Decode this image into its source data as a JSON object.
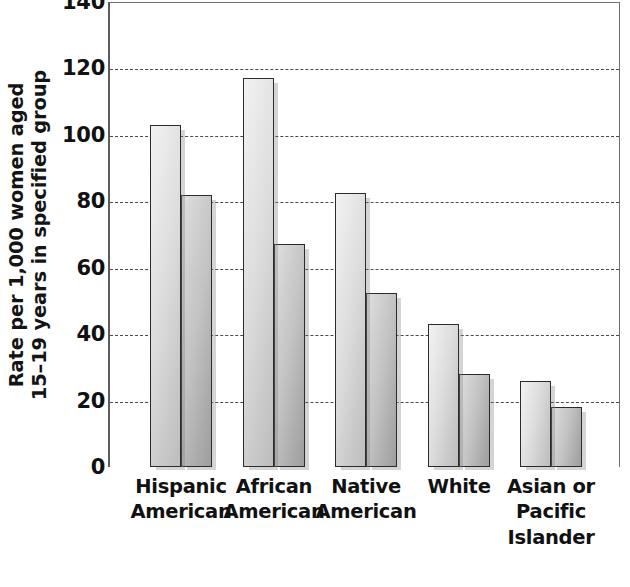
{
  "chart_data": {
    "type": "bar",
    "title": "",
    "subtitle": "",
    "xlabel": "",
    "ylabel_line1": "Rate per 1,000 women aged",
    "ylabel_line2": "15–19 years in specified group",
    "categories": [
      [
        "Hispanic",
        "American"
      ],
      [
        "African",
        "American"
      ],
      [
        "Native",
        "American"
      ],
      [
        "White"
      ],
      [
        "Asian or",
        "Pacific",
        "Islander"
      ]
    ],
    "category_names": [
      "Hispanic American",
      "African American",
      "Native American",
      "White",
      "Asian or Pacific Islander"
    ],
    "series": [
      {
        "name": "series-1",
        "values": [
          103,
          117,
          82.5,
          43,
          26
        ]
      },
      {
        "name": "series-2",
        "values": [
          82,
          67,
          52.5,
          28,
          18
        ]
      }
    ],
    "ylim": [
      0,
      140
    ],
    "yticks": [
      0,
      20,
      40,
      60,
      80,
      100,
      120,
      140
    ],
    "ytick_labels": [
      "0",
      "20",
      "40",
      "60",
      "80",
      "100",
      "120",
      "140"
    ],
    "grid": true,
    "grid_style": "dashed",
    "legend": "none",
    "colors": {
      "series_1_fill": "#dcdcdc",
      "series_2_fill": "#bdbdbd",
      "bar_border": "#2b2b2b",
      "gridline": "#4a4a4a",
      "axis": "#5d5d5d",
      "text": "#111111",
      "background": "#ffffff"
    }
  }
}
